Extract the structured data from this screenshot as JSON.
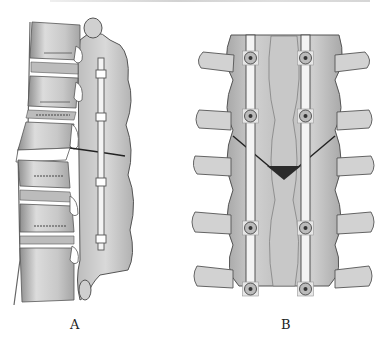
{
  "figure": {
    "panels": [
      {
        "id": "A",
        "label": "A",
        "view": "lateral view of lumbar spine with posterior rod fixation and osteotomy gap"
      },
      {
        "id": "B",
        "label": "B",
        "view": "posterior view of spine with bilateral rods and pedicle screws, wedge osteotomy"
      }
    ],
    "colors": {
      "bone": "#d4d4d4",
      "bone_shadow": "#9a9a9a",
      "outline": "#555555",
      "rod": "#f2f2f2",
      "osteotomy_wedge": "#2a2a2a",
      "background": "#ffffff"
    }
  }
}
